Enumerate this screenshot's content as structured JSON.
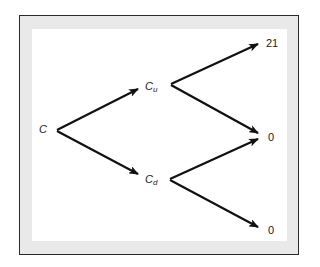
{
  "diagram": {
    "type": "binomial-tree",
    "nodes": {
      "root": {
        "label": "C"
      },
      "up": {
        "label": "C",
        "subscript": "u"
      },
      "down": {
        "label": "C",
        "subscript": "d"
      },
      "uu": {
        "label": "21"
      },
      "ud": {
        "label": "0"
      },
      "dd": {
        "label": "0"
      }
    },
    "edges": [
      {
        "from": "root",
        "to": "up"
      },
      {
        "from": "root",
        "to": "down"
      },
      {
        "from": "up",
        "to": "uu"
      },
      {
        "from": "up",
        "to": "ud"
      },
      {
        "from": "down",
        "to": "ud"
      },
      {
        "from": "down",
        "to": "dd"
      }
    ],
    "colors": {
      "frame": "#2a2a2a",
      "mat": "#e9e9e9",
      "arrow": "#111111"
    }
  }
}
